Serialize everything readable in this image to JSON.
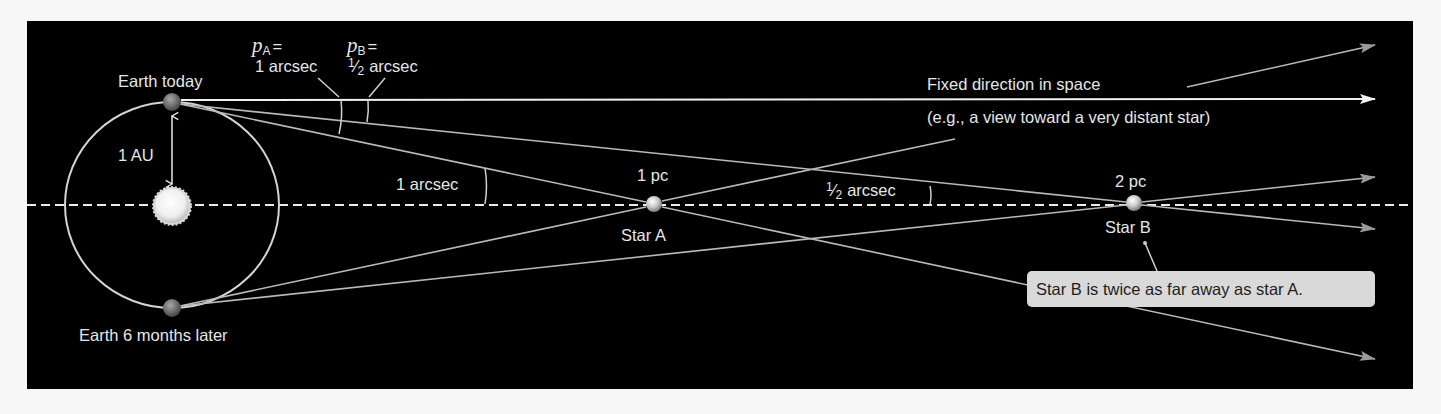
{
  "figure": {
    "background": "#000000",
    "page_background": "#f7f7f7",
    "label_color": "#e6e6e6",
    "line_color": "#b9b9b9"
  },
  "labels": {
    "earth_today": "Earth today",
    "earth_later": "Earth 6 months later",
    "au": "1 AU",
    "pA_symbol": "p",
    "pA_sub": "A",
    "pA_eq": "=",
    "pA_value": "1 arcsec",
    "pB_symbol": "p",
    "pB_sub": "B",
    "pB_eq": "=",
    "pB_value_num": "1",
    "pB_value_den": "2",
    "pB_value_unit": "arcsec",
    "angle_A": "1 arcsec",
    "angle_B_num": "1",
    "angle_B_den": "2",
    "angle_B_unit": "arcsec",
    "star_A_distance": "1 pc",
    "star_A_name": "Star A",
    "star_B_distance": "2 pc",
    "star_B_name": "Star B",
    "fixed_direction_line1": "Fixed direction in space",
    "fixed_direction_line2": "(e.g., a view toward a very distant star)",
    "callout": "Star B is twice as far away as star A."
  },
  "objects": {
    "sun": {
      "x": 172,
      "y": 206,
      "r": 17
    },
    "earth_today": {
      "x": 172,
      "y": 102,
      "r": 9
    },
    "earth_later": {
      "x": 172,
      "y": 308,
      "r": 9
    },
    "star_A": {
      "x": 654,
      "y": 204,
      "r": 8,
      "distance_pc": 1,
      "parallax_arcsec": 1
    },
    "star_B": {
      "x": 1134,
      "y": 203,
      "r": 8,
      "distance_pc": 2,
      "parallax_arcsec": 0.5
    }
  }
}
